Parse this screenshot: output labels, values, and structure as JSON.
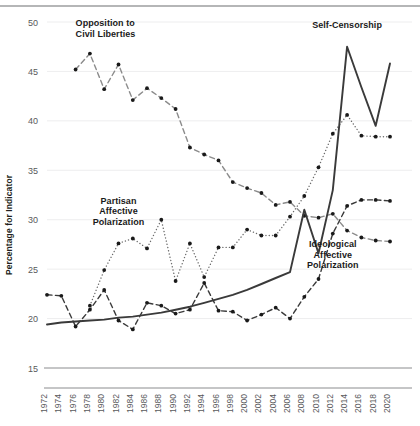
{
  "chart_data": {
    "type": "line",
    "title": "",
    "xlabel": "",
    "ylabel": "Percentage for Indicator",
    "ylim": [
      15,
      50
    ],
    "yticks": [
      15,
      20,
      25,
      30,
      35,
      40,
      45,
      50
    ],
    "grid": true,
    "legend_position": "inline-annotations",
    "x": [
      1972,
      1974,
      1976,
      1978,
      1980,
      1982,
      1984,
      1986,
      1988,
      1990,
      1992,
      1994,
      1996,
      1998,
      2000,
      2002,
      2004,
      2006,
      2008,
      2010,
      2012,
      2014,
      2016,
      2018,
      2020
    ],
    "xtick_labels": [
      "1972",
      "1974",
      "1976",
      "1978",
      "1980",
      "1982",
      "1984",
      "1986",
      "1988",
      "1990",
      "1992",
      "1994",
      "1996",
      "1998",
      "2000",
      "2002",
      "2004",
      "2006",
      "2008",
      "2010",
      "2012",
      "2014",
      "2016",
      "2018",
      "2020"
    ],
    "series": [
      {
        "name": "Opposition to Civil Liberties",
        "style": "dashed",
        "color": "#8c8c8c",
        "marker": "circle",
        "label_anchor": {
          "x": 1976,
          "y": 49.6
        },
        "x": [
          1976,
          1978,
          1980,
          1982,
          1984,
          1986,
          1988,
          1990,
          1992,
          1994,
          1996,
          1998,
          2000,
          2002,
          2004,
          2006,
          2008,
          2010,
          2012,
          2014,
          2016,
          2018,
          2020
        ],
        "values": [
          45.2,
          46.8,
          43.2,
          45.7,
          42.1,
          43.3,
          42.3,
          41.2,
          37.3,
          36.6,
          36.0,
          33.8,
          33.2,
          32.7,
          31.5,
          31.8,
          30.4,
          30.2,
          30.6,
          28.9,
          28.2,
          27.9,
          27.8
        ]
      },
      {
        "name": "Partisan Affective Polarization",
        "style": "dotted",
        "color": "#6b6b6b",
        "marker": "circle",
        "label_anchor": {
          "x": 1982,
          "y": 31.6
        },
        "x": [
          1978,
          1980,
          1982,
          1984,
          1986,
          1988,
          1990,
          1992,
          1994,
          1996,
          1998,
          2000,
          2002,
          2004,
          2006,
          2008,
          2010,
          2012,
          2014,
          2016,
          2018,
          2020
        ],
        "values": [
          21.3,
          24.9,
          27.6,
          28.1,
          27.1,
          30.0,
          23.8,
          27.6,
          24.2,
          27.2,
          27.2,
          29.0,
          28.4,
          28.4,
          30.3,
          32.4,
          35.3,
          38.7,
          40.6,
          38.5,
          38.4,
          38.4
        ]
      },
      {
        "name": "Self-Censorship",
        "style": "solid",
        "color": "#3a3a3a",
        "marker": "none",
        "label_anchor": {
          "x": 2014,
          "y": 49.4
        },
        "x": [
          1972,
          1974,
          1976,
          1978,
          1980,
          1982,
          1984,
          1986,
          1988,
          1990,
          1992,
          1994,
          1996,
          1998,
          2000,
          2002,
          2004,
          2006,
          2008,
          2010,
          2012,
          2014,
          2016,
          2018,
          2020
        ],
        "values": [
          19.4,
          19.6,
          19.7,
          19.8,
          19.9,
          20.1,
          20.2,
          20.4,
          20.6,
          20.9,
          21.2,
          21.6,
          22.0,
          22.4,
          22.9,
          23.5,
          24.1,
          24.7,
          31.0,
          26.6,
          33.0,
          47.5,
          43.4,
          39.5,
          45.8
        ]
      },
      {
        "name": "Ideological Affective Polarization",
        "style": "dashed",
        "color": "#3a3a3a",
        "marker": "circle",
        "label_anchor": {
          "x": 2012,
          "y": 27.2
        },
        "x": [
          1972,
          1974,
          1976,
          1978,
          1980,
          1982,
          1984,
          1986,
          1988,
          1990,
          1992,
          1994,
          1996,
          1998,
          2000,
          2002,
          2004,
          2006,
          2008,
          2010,
          2012,
          2014,
          2016,
          2018,
          2020
        ],
        "values": [
          22.4,
          22.3,
          19.2,
          20.9,
          22.9,
          19.8,
          18.9,
          21.6,
          21.3,
          20.5,
          20.9,
          23.6,
          20.8,
          20.7,
          19.8,
          20.4,
          21.1,
          20.0,
          22.2,
          24.0,
          28.6,
          31.4,
          32.0,
          32.0,
          31.9
        ]
      }
    ]
  },
  "axis": {
    "ylabel": "Percentage for Indicator"
  },
  "annotations": [
    {
      "id": "opposition",
      "lines": [
        "Opposition to",
        "Civil Liberties"
      ]
    },
    {
      "id": "partisan",
      "lines": [
        "Partisan",
        "Affective",
        "Polarization"
      ]
    },
    {
      "id": "self-censorship",
      "lines": [
        "Self-Censorship"
      ]
    },
    {
      "id": "ideological",
      "lines": [
        "Ideological",
        "Affective",
        "Polarization"
      ]
    }
  ]
}
